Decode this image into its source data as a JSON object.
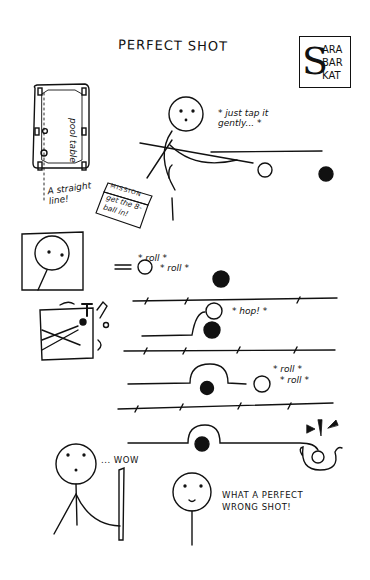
{
  "comic": {
    "title": "PERFECT SHOT",
    "signature": {
      "initial": "S",
      "lines": [
        "ARA",
        "BAR",
        "KAT"
      ]
    },
    "panel1": {
      "table_label": "pool table",
      "straight_line_note": "A straight line!",
      "mission_card": {
        "header": "MISSION",
        "body": "get the 8-ball in!"
      },
      "speech": "* just tap it gently... *"
    },
    "panel2": {
      "sfx_roll_1": "* roll *",
      "sfx_roll_2": "* roll *",
      "sfx_hop": "* hop! *",
      "sfx_roll_3": "* roll *",
      "sfx_roll_4": "* roll *",
      "ball_label": "8"
    },
    "panel3": {
      "reaction": "... WOW",
      "closing_line_1": "WHAT A PERFECT",
      "closing_line_2": "WRONG SHOT!"
    }
  }
}
